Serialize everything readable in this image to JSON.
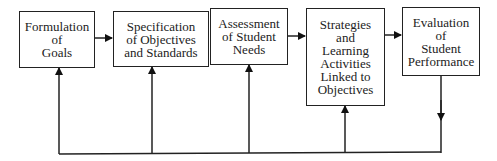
{
  "diagram": {
    "type": "flowchart",
    "nodes": [
      {
        "id": "n1",
        "label": "Formulation\nof\nGoals"
      },
      {
        "id": "n2",
        "label": "Specification\nof Objectives\nand Standards"
      },
      {
        "id": "n3",
        "label": "Assessment\nof Student\nNeeds"
      },
      {
        "id": "n4",
        "label": "Strategies\nand\nLearning\nActivities\nLinked to\nObjectives"
      },
      {
        "id": "n5",
        "label": "Evaluation\nof\nStudent\nPerformance"
      }
    ],
    "edges": [
      {
        "from": "n1",
        "to": "n2"
      },
      {
        "from": "n2",
        "to": "n3"
      },
      {
        "from": "n3",
        "to": "n4"
      },
      {
        "from": "n4",
        "to": "n5"
      },
      {
        "from": "n5",
        "to": "feedback-line"
      },
      {
        "from": "feedback-line",
        "to": "n1"
      },
      {
        "from": "feedback-line",
        "to": "n2"
      },
      {
        "from": "feedback-line",
        "to": "n3"
      },
      {
        "from": "feedback-line",
        "to": "n4"
      }
    ]
  }
}
